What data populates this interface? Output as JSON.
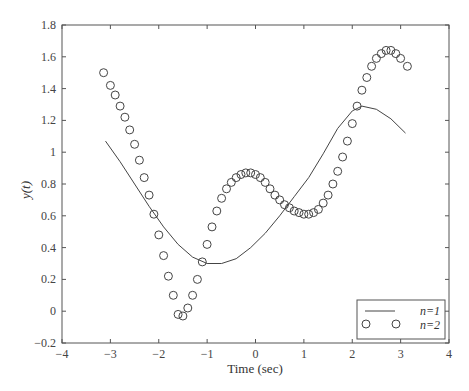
{
  "chart_data": {
    "type": "line",
    "title": "",
    "xlabel": "Time (sec)",
    "ylabel": "y(t)",
    "xlim": [
      -4,
      4
    ],
    "ylim": [
      -0.2,
      1.8
    ],
    "xticks": [
      -4,
      -3,
      -2,
      -1,
      0,
      1,
      2,
      3,
      4
    ],
    "xtick_labels": [
      "−4",
      "−3",
      "−2",
      "−1",
      "0",
      "1",
      "2",
      "3",
      "4"
    ],
    "yticks": [
      -0.2,
      0,
      0.2,
      0.4,
      0.6,
      0.8,
      1,
      1.2,
      1.4,
      1.6,
      1.8
    ],
    "ytick_labels": [
      "−0.2",
      "0",
      "0.2",
      "0.4",
      "0.6",
      "0.8",
      "1",
      "1.2",
      "1.4",
      "1.6",
      "1.8"
    ],
    "grid": false,
    "legend_position": "lower right",
    "series": [
      {
        "name": "n=1",
        "style": "solid-line",
        "x": [
          -3.1,
          -2.8,
          -2.5,
          -2.2,
          -1.9,
          -1.6,
          -1.3,
          -1.0,
          -0.7,
          -0.4,
          -0.1,
          0.2,
          0.5,
          0.8,
          1.1,
          1.4,
          1.7,
          2.0,
          2.2,
          2.5,
          2.8,
          3.1
        ],
        "values": [
          1.07,
          0.94,
          0.8,
          0.66,
          0.53,
          0.42,
          0.34,
          0.3,
          0.3,
          0.33,
          0.4,
          0.49,
          0.6,
          0.72,
          0.84,
          0.99,
          1.15,
          1.26,
          1.29,
          1.27,
          1.21,
          1.12
        ]
      },
      {
        "name": "n=2",
        "style": "circle-markers",
        "x": [
          -3.14,
          -3.0,
          -2.9,
          -2.8,
          -2.7,
          -2.6,
          -2.5,
          -2.4,
          -2.3,
          -2.2,
          -2.1,
          -2.0,
          -1.9,
          -1.8,
          -1.7,
          -1.6,
          -1.5,
          -1.4,
          -1.3,
          -1.2,
          -1.1,
          -1.0,
          -0.9,
          -0.8,
          -0.7,
          -0.6,
          -0.5,
          -0.4,
          -0.3,
          -0.2,
          -0.1,
          0.0,
          0.1,
          0.2,
          0.3,
          0.4,
          0.5,
          0.6,
          0.7,
          0.8,
          0.9,
          1.0,
          1.1,
          1.2,
          1.3,
          1.4,
          1.5,
          1.6,
          1.7,
          1.8,
          1.9,
          2.0,
          2.1,
          2.2,
          2.3,
          2.4,
          2.5,
          2.6,
          2.7,
          2.8,
          2.9,
          3.0,
          3.14
        ],
        "values": [
          1.5,
          1.42,
          1.36,
          1.29,
          1.22,
          1.14,
          1.05,
          0.95,
          0.84,
          0.73,
          0.61,
          0.48,
          0.35,
          0.22,
          0.1,
          -0.02,
          -0.03,
          0.02,
          0.1,
          0.2,
          0.31,
          0.42,
          0.53,
          0.63,
          0.71,
          0.77,
          0.81,
          0.84,
          0.86,
          0.87,
          0.87,
          0.86,
          0.84,
          0.81,
          0.77,
          0.73,
          0.7,
          0.67,
          0.65,
          0.63,
          0.62,
          0.61,
          0.61,
          0.62,
          0.64,
          0.68,
          0.73,
          0.8,
          0.88,
          0.97,
          1.07,
          1.18,
          1.29,
          1.39,
          1.47,
          1.54,
          1.59,
          1.62,
          1.64,
          1.64,
          1.62,
          1.59,
          1.54
        ]
      }
    ]
  },
  "legend": {
    "items": [
      {
        "label": "n=1",
        "symbol": "line"
      },
      {
        "label": "n=2",
        "symbol": "circle"
      }
    ]
  }
}
